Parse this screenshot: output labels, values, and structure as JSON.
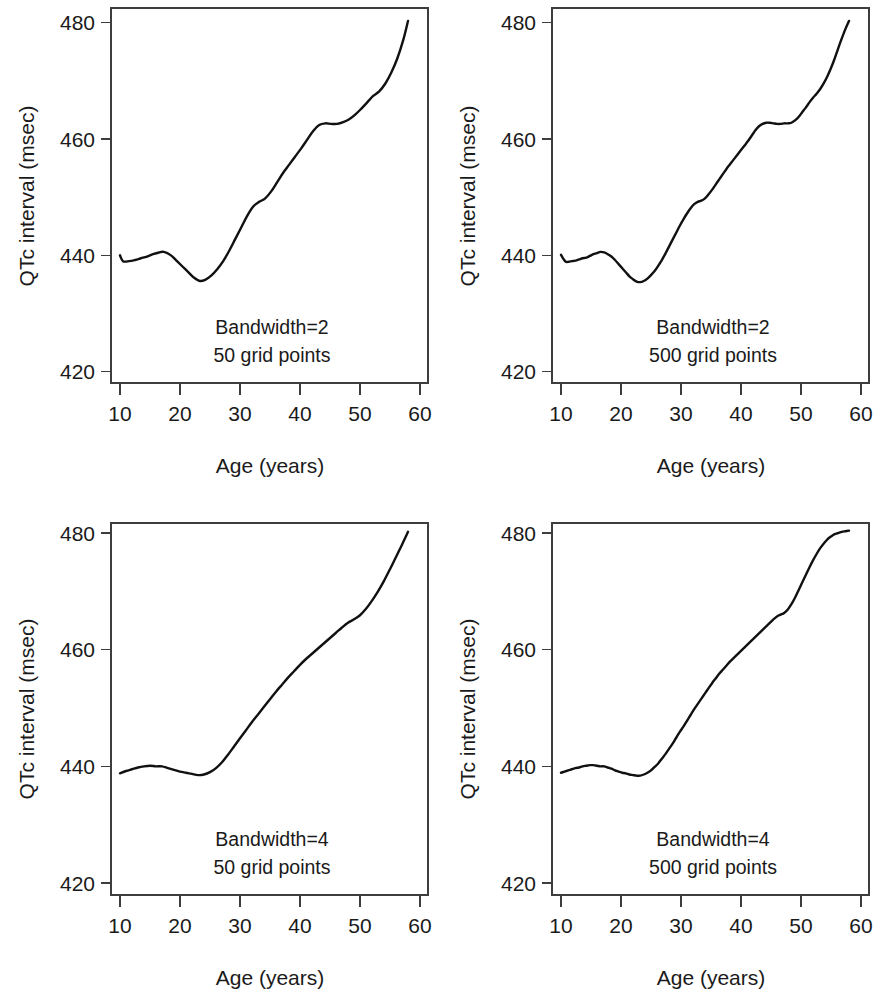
{
  "figure": {
    "background": "#ffffff",
    "line_color": "#111111",
    "axis_color": "#3d3d3d",
    "panel_count": 4,
    "layout": "2x2 grid of line plots"
  },
  "chart_data": [
    {
      "id": "top-left",
      "type": "line",
      "title": "",
      "xlabel": "Age (years)",
      "ylabel": "QTc interval (msec)",
      "xlim": [
        9,
        60
      ],
      "ylim": [
        418,
        482
      ],
      "xticks": [
        10,
        20,
        30,
        40,
        50,
        60
      ],
      "yticks": [
        420,
        440,
        460,
        480
      ],
      "grid": false,
      "legend": "none",
      "annotations": [
        "Bandwidth=2",
        "50 grid points"
      ],
      "bandwidth": 2,
      "grid_points": 50,
      "x": [
        10.0,
        10.5,
        11.5,
        12.5,
        13.5,
        14.5,
        15.5,
        16.5,
        17.3,
        18.5,
        19.5,
        20.5,
        21.5,
        22.3,
        23.3,
        24.2,
        25.2,
        26.2,
        27.2,
        28.2,
        29.2,
        30.2,
        31.2,
        32.2,
        33.2,
        34.2,
        35.2,
        36.2,
        37.2,
        38.2,
        39.2,
        40.2,
        41.2,
        42.2,
        43.2,
        44.2,
        45.2,
        46.2,
        47.2,
        48.2,
        49.2,
        50.2,
        51.2,
        52.2,
        53.2,
        54.2,
        55.2,
        56.2,
        57.2,
        58.0
      ],
      "y": [
        440.0,
        439.0,
        439.0,
        439.2,
        439.5,
        439.8,
        440.2,
        440.5,
        440.6,
        440.0,
        439.0,
        438.0,
        437.0,
        436.2,
        435.6,
        435.8,
        436.5,
        437.6,
        439.0,
        440.8,
        442.8,
        444.8,
        446.8,
        448.4,
        449.2,
        449.8,
        451.0,
        452.6,
        454.2,
        455.6,
        457.0,
        458.4,
        459.9,
        461.4,
        462.4,
        462.7,
        462.6,
        462.6,
        462.9,
        463.4,
        464.2,
        465.2,
        466.3,
        467.4,
        468.2,
        469.5,
        471.4,
        473.8,
        477.0,
        480.3
      ]
    },
    {
      "id": "top-right",
      "type": "line",
      "title": "",
      "xlabel": "Age (years)",
      "ylabel": "QTc interval (msec)",
      "xlim": [
        9,
        60
      ],
      "ylim": [
        418,
        482
      ],
      "xticks": [
        10,
        20,
        30,
        40,
        50,
        60
      ],
      "yticks": [
        420,
        440,
        460,
        480
      ],
      "grid": false,
      "legend": "none",
      "annotations": [
        "Bandwidth=2",
        "500 grid points"
      ],
      "bandwidth": 2,
      "grid_points": 500,
      "x": [
        10.0,
        10.4,
        10.8,
        11.3,
        11.8,
        12.4,
        13.0,
        13.6,
        14.2,
        14.8,
        15.4,
        16.0,
        16.6,
        17.2,
        17.8,
        18.4,
        19.0,
        19.6,
        20.2,
        20.8,
        21.4,
        22.0,
        22.6,
        23.2,
        23.8,
        24.4,
        25.0,
        25.6,
        26.2,
        26.8,
        27.4,
        28.0,
        28.6,
        29.2,
        29.8,
        30.4,
        31.0,
        31.6,
        32.2,
        32.8,
        33.4,
        34.0,
        34.6,
        35.2,
        35.8,
        36.4,
        37.0,
        37.6,
        38.2,
        38.8,
        39.4,
        40.0,
        40.6,
        41.2,
        41.8,
        42.4,
        43.0,
        43.6,
        44.2,
        44.8,
        45.4,
        46.0,
        46.6,
        47.2,
        47.8,
        48.4,
        49.0,
        49.6,
        50.2,
        50.8,
        51.4,
        52.0,
        52.6,
        53.2,
        53.8,
        54.4,
        55.0,
        55.6,
        56.2,
        56.8,
        57.4,
        58.0
      ],
      "y": [
        440.1,
        439.4,
        438.9,
        438.9,
        439.0,
        439.1,
        439.3,
        439.5,
        439.6,
        439.9,
        440.2,
        440.4,
        440.6,
        440.5,
        440.2,
        439.8,
        439.2,
        438.5,
        437.8,
        437.1,
        436.4,
        435.9,
        435.5,
        435.4,
        435.6,
        436.0,
        436.6,
        437.3,
        438.2,
        439.2,
        440.3,
        441.5,
        442.7,
        443.9,
        445.1,
        446.2,
        447.2,
        448.1,
        448.8,
        449.2,
        449.4,
        449.8,
        450.5,
        451.3,
        452.2,
        453.1,
        454.0,
        454.9,
        455.7,
        456.5,
        457.3,
        458.1,
        458.9,
        459.7,
        460.6,
        461.5,
        462.2,
        462.6,
        462.8,
        462.8,
        462.7,
        462.6,
        462.6,
        462.7,
        462.7,
        462.8,
        463.2,
        463.8,
        464.6,
        465.4,
        466.3,
        467.1,
        467.8,
        468.6,
        469.6,
        470.8,
        472.2,
        473.8,
        475.6,
        477.3,
        478.9,
        480.3
      ]
    },
    {
      "id": "bottom-left",
      "type": "line",
      "title": "",
      "xlabel": "Age (years)",
      "ylabel": "QTc interval (msec)",
      "xlim": [
        9,
        60
      ],
      "ylim": [
        418,
        482
      ],
      "xticks": [
        10,
        20,
        30,
        40,
        50,
        60
      ],
      "yticks": [
        420,
        440,
        460,
        480
      ],
      "grid": false,
      "legend": "none",
      "annotations": [
        "Bandwidth=4",
        "50 grid points"
      ],
      "bandwidth": 4,
      "grid_points": 50,
      "x": [
        10.0,
        11.0,
        12.0,
        13.0,
        14.0,
        15.0,
        16.0,
        17.0,
        18.0,
        19.0,
        20.0,
        21.0,
        22.0,
        23.0,
        24.0,
        25.0,
        26.0,
        27.0,
        28.0,
        29.0,
        30.0,
        31.0,
        32.0,
        33.0,
        34.0,
        35.0,
        36.0,
        37.0,
        38.0,
        39.0,
        40.0,
        41.0,
        42.0,
        43.0,
        44.0,
        45.0,
        46.0,
        47.0,
        48.0,
        49.0,
        50.0,
        51.0,
        52.0,
        53.0,
        54.0,
        55.0,
        56.0,
        57.0,
        57.6,
        58.0
      ],
      "y": [
        438.8,
        439.2,
        439.5,
        439.8,
        440.0,
        440.1,
        440.0,
        440.0,
        439.7,
        439.4,
        439.1,
        438.9,
        438.7,
        438.5,
        438.6,
        439.0,
        439.7,
        440.7,
        442.0,
        443.4,
        444.8,
        446.2,
        447.6,
        448.9,
        450.2,
        451.5,
        452.8,
        454.0,
        455.2,
        456.3,
        457.4,
        458.4,
        459.3,
        460.2,
        461.1,
        462.0,
        462.9,
        463.8,
        464.6,
        465.2,
        465.9,
        467.0,
        468.4,
        470.0,
        471.8,
        473.8,
        475.9,
        478.0,
        479.3,
        480.2
      ]
    },
    {
      "id": "bottom-right",
      "type": "line",
      "title": "",
      "xlabel": "Age (years)",
      "ylabel": "QTc interval (msec)",
      "xlim": [
        9,
        60
      ],
      "ylim": [
        418,
        482
      ],
      "xticks": [
        10,
        20,
        30,
        40,
        50,
        60
      ],
      "yticks": [
        420,
        440,
        460,
        480
      ],
      "grid": false,
      "legend": "none",
      "annotations": [
        "Bandwidth=4",
        "500 grid points"
      ],
      "bandwidth": 4,
      "grid_points": 500,
      "x": [
        10.0,
        10.6,
        11.2,
        11.8,
        12.4,
        13.0,
        13.6,
        14.2,
        14.8,
        15.4,
        16.0,
        16.6,
        17.2,
        17.8,
        18.4,
        19.0,
        19.6,
        20.2,
        20.8,
        21.4,
        22.0,
        22.6,
        23.2,
        23.8,
        24.4,
        25.0,
        25.6,
        26.2,
        26.8,
        27.4,
        28.0,
        28.6,
        29.2,
        29.8,
        30.4,
        31.0,
        31.6,
        32.2,
        32.8,
        33.4,
        34.0,
        34.6,
        35.2,
        35.8,
        36.4,
        37.0,
        37.6,
        38.2,
        38.8,
        39.4,
        40.0,
        40.6,
        41.2,
        41.8,
        42.4,
        43.0,
        43.6,
        44.2,
        44.8,
        45.4,
        46.0,
        46.6,
        47.2,
        47.8,
        48.4,
        49.0,
        49.6,
        50.2,
        50.8,
        51.4,
        52.0,
        52.6,
        53.2,
        53.8,
        54.4,
        55.0,
        55.6,
        56.2,
        56.8,
        57.4,
        58.0
      ],
      "y": [
        438.9,
        439.1,
        439.3,
        439.5,
        439.7,
        439.8,
        440.0,
        440.1,
        440.2,
        440.2,
        440.1,
        440.0,
        440.0,
        439.8,
        439.6,
        439.3,
        439.1,
        438.9,
        438.8,
        438.6,
        438.5,
        438.4,
        438.4,
        438.6,
        438.9,
        439.3,
        439.9,
        440.5,
        441.3,
        442.1,
        443.0,
        443.9,
        444.9,
        445.9,
        446.8,
        447.8,
        448.8,
        449.8,
        450.7,
        451.6,
        452.5,
        453.4,
        454.3,
        455.1,
        455.9,
        456.6,
        457.3,
        458.0,
        458.6,
        459.2,
        459.8,
        460.4,
        461.0,
        461.6,
        462.2,
        462.8,
        463.4,
        464.0,
        464.6,
        465.2,
        465.7,
        466.0,
        466.3,
        466.9,
        467.8,
        468.9,
        470.2,
        471.5,
        472.8,
        474.1,
        475.3,
        476.4,
        477.4,
        478.2,
        478.9,
        479.4,
        479.8,
        480.0,
        480.2,
        480.3,
        480.4
      ]
    }
  ],
  "panels": [
    {
      "name": "panel-top-left",
      "ylabel": "QTc interval (msec)",
      "xlabel": "Age (years)",
      "yticklabels": [
        "480",
        "460",
        "440",
        "420"
      ],
      "xticklabels": [
        "10",
        "20",
        "30",
        "40",
        "50",
        "60"
      ],
      "annotation_line1": "Bandwidth=2",
      "annotation_line2": "50 grid points"
    },
    {
      "name": "panel-top-right",
      "ylabel": "QTc interval (msec)",
      "xlabel": "Age (years)",
      "yticklabels": [
        "480",
        "460",
        "440",
        "420"
      ],
      "xticklabels": [
        "10",
        "20",
        "30",
        "40",
        "50",
        "60"
      ],
      "annotation_line1": "Bandwidth=2",
      "annotation_line2": "500 grid points"
    },
    {
      "name": "panel-bottom-left",
      "ylabel": "QTc interval (msec)",
      "xlabel": "Age (years)",
      "yticklabels": [
        "480",
        "460",
        "440",
        "420"
      ],
      "xticklabels": [
        "10",
        "20",
        "30",
        "40",
        "50",
        "60"
      ],
      "annotation_line1": "Bandwidth=4",
      "annotation_line2": "50 grid points"
    },
    {
      "name": "panel-bottom-right",
      "ylabel": "QTc interval (msec)",
      "xlabel": "Age (years)",
      "yticklabels": [
        "480",
        "460",
        "440",
        "420"
      ],
      "xticklabels": [
        "10",
        "20",
        "30",
        "40",
        "50",
        "60"
      ],
      "annotation_line1": "Bandwidth=4",
      "annotation_line2": "500 grid points"
    }
  ]
}
